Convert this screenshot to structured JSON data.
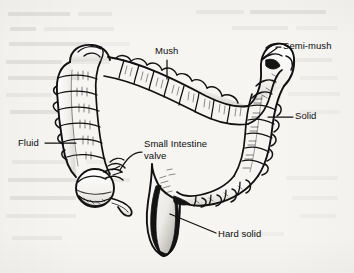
{
  "figure": {
    "style": "pen-and-ink line drawing on scanned book page",
    "background_color": "#f6f5f2",
    "ink_color": "#111111"
  },
  "labels": {
    "mush": "Mush",
    "semi_mush": "Semi-mush",
    "solid": "Solid",
    "fluid": "Fluid",
    "small_intestine_valve": "Small Intestine\nvalve",
    "hard_solid": "Hard solid"
  },
  "anatomy_parts": [
    "transverse-colon",
    "ascending-colon",
    "descending-colon",
    "hepatic-flexure",
    "splenic-flexure",
    "cecum",
    "appendix",
    "ileocecal-valve",
    "sigmoid-colon",
    "rectum"
  ],
  "leader_lines": [
    {
      "name": "mush-leader",
      "style": "vertical"
    },
    {
      "name": "semi-mush-leader",
      "style": "horizontal"
    },
    {
      "name": "solid-leader",
      "style": "horizontal"
    },
    {
      "name": "fluid-leader",
      "style": "horizontal"
    },
    {
      "name": "small-intestine-valve-leader",
      "style": "curved"
    },
    {
      "name": "hard-solid-leader",
      "style": "angled"
    }
  ]
}
